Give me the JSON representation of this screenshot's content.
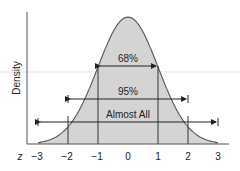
{
  "chart_data": {
    "type": "area",
    "title": "",
    "xlabel": "z",
    "ylabel": "Density",
    "x_ticks": [
      "−3",
      "−2",
      "−1",
      "0",
      "1",
      "2",
      "3"
    ],
    "xlim": [
      -3,
      3
    ],
    "distribution": "standard normal",
    "intervals": [
      {
        "label": "68%",
        "from": -1,
        "to": 1
      },
      {
        "label": "95%",
        "from": -2,
        "to": 2
      },
      {
        "label": "Almost All",
        "from": -3,
        "to": 3
      }
    ],
    "grid": false,
    "fill_color": "#d3d3d3",
    "line_color": "#555555"
  }
}
